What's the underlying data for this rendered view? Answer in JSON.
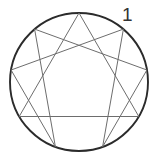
{
  "figure": {
    "label_visible": "1",
    "label_position": {
      "x": 122,
      "y": 5
    },
    "colors": {
      "background": "#ffffff",
      "circle_stroke": "#2b2b2b",
      "inner_line_stroke": "#6d6d6d",
      "label_text": "#333333"
    },
    "canvas": {
      "width": 157,
      "height": 163
    }
  },
  "chart_data": {
    "type": "diagram",
    "geometry": {
      "center": {
        "x": 79,
        "y": 82
      },
      "radius": 69,
      "point_count": 9,
      "start_angle_deg": -90,
      "step_deg": 40
    },
    "points": [
      {
        "number": 1,
        "angle_deg": -50,
        "x": 123.4,
        "y": 29.1
      },
      {
        "number": 2,
        "angle_deg": -10,
        "x": 146.9,
        "y": 70.0
      },
      {
        "number": 3,
        "angle_deg": 30,
        "x": 138.8,
        "y": 116.5
      },
      {
        "number": 4,
        "angle_deg": 70,
        "x": 102.6,
        "y": 146.8
      },
      {
        "number": 5,
        "angle_deg": 110,
        "x": 55.4,
        "y": 146.8
      },
      {
        "number": 6,
        "angle_deg": 150,
        "x": 19.2,
        "y": 116.5
      },
      {
        "number": 7,
        "angle_deg": 190,
        "x": 11.1,
        "y": 70.0
      },
      {
        "number": 8,
        "angle_deg": 230,
        "x": 34.6,
        "y": 29.1
      },
      {
        "number": 9,
        "angle_deg": 270,
        "x": 79.0,
        "y": 13.0
      }
    ],
    "triangle_sequence": [
      9,
      3,
      6,
      9
    ],
    "hexad_sequence": [
      1,
      4,
      2,
      8,
      5,
      7,
      1
    ],
    "labels_shown": [
      "1"
    ],
    "legend": [],
    "grid": false
  }
}
